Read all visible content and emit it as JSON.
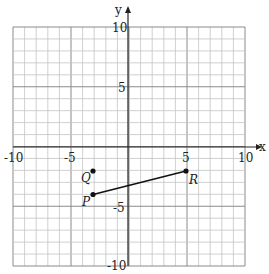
{
  "chart_data": {
    "type": "scatter",
    "title": "",
    "xlabel": "x",
    "ylabel": "y",
    "xlim": [
      -10,
      10
    ],
    "ylim": [
      -10,
      10
    ],
    "grid": true,
    "grid_step": 1,
    "x_ticks": [
      -10,
      -5,
      5,
      10
    ],
    "y_ticks": [
      10,
      5,
      -5,
      -10
    ],
    "points": [
      {
        "name": "Q",
        "x": -3,
        "y": -2
      },
      {
        "name": "P",
        "x": -3,
        "y": -4
      },
      {
        "name": "R",
        "x": 5,
        "y": -2
      }
    ],
    "segments": [
      {
        "from": "P",
        "to": "R"
      }
    ]
  },
  "axes": {
    "x_label": "x",
    "y_label": "y",
    "x_tick_labels": [
      "-10",
      "-5",
      "5",
      "10"
    ],
    "y_tick_labels": [
      "10",
      "5",
      "-5",
      "-10"
    ]
  },
  "points": {
    "q_label": "Q",
    "p_label": "P",
    "r_label": "R"
  }
}
